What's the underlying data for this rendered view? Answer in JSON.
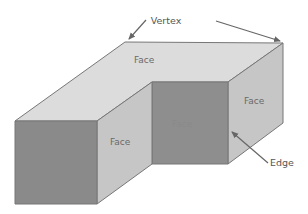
{
  "diagram": {
    "labels": {
      "top_face": "Face",
      "front_left_face": "Face",
      "front_left_side_face": "Face",
      "inner_front_face": "Face",
      "right_side_face": "Face"
    },
    "callouts": {
      "vertex": "Vertex",
      "edge": "Edge"
    },
    "colors": {
      "top_face": "#dcdcdc",
      "side_face": "#c4c4c4",
      "front_face": "#8c8c8c",
      "edge_stroke": "#777777",
      "arrow": "#666666"
    }
  }
}
